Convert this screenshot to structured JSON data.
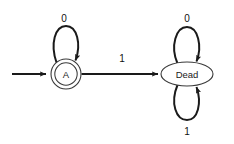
{
  "diagram": {
    "kind": "finite-state-automaton",
    "background_color": "#ffffff",
    "stroke_color": "#1a1a1a",
    "state_stroke_color": "#3a3a3a",
    "states": [
      {
        "id": "A",
        "label": "A",
        "shape": "double-circle",
        "accepting": true,
        "initial": true,
        "cx": 66,
        "cy": 74,
        "r_outer": 15,
        "r_inner": 11.2
      },
      {
        "id": "Dead",
        "label": "Dead",
        "shape": "ellipse",
        "accepting": false,
        "initial": false,
        "cx": 187,
        "cy": 74,
        "rx": 26,
        "ry": 12
      }
    ],
    "start_arrow": {
      "name": "start-arrow",
      "from_x": 12,
      "to_x": 48,
      "y": 74
    },
    "transitions": [
      {
        "id": "a-self-0",
        "from": "A",
        "to": "A",
        "symbol": "0",
        "type": "self-loop",
        "position": "top",
        "label_x": 64,
        "label_y": 18
      },
      {
        "id": "a-to-dead-1",
        "from": "A",
        "to": "Dead",
        "symbol": "1",
        "type": "straight",
        "position": "middle",
        "label_x": 122,
        "label_y": 58
      },
      {
        "id": "dead-self-0",
        "from": "Dead",
        "to": "Dead",
        "symbol": "0",
        "type": "self-loop",
        "position": "top",
        "label_x": 187,
        "label_y": 18
      },
      {
        "id": "dead-self-1",
        "from": "Dead",
        "to": "Dead",
        "symbol": "1",
        "type": "self-loop",
        "position": "bottom",
        "label_x": 187,
        "label_y": 131
      }
    ]
  }
}
